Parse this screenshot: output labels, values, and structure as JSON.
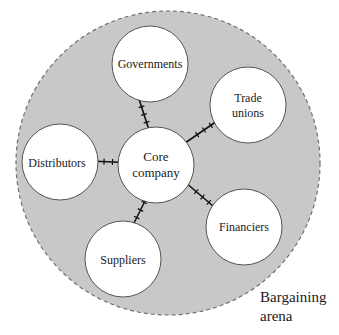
{
  "diagram": {
    "arena": {
      "label_line1": "Bargaining",
      "label_line2": "arena",
      "fill": "#c8c8c8",
      "border": "#707070",
      "cx": 168,
      "cy": 163,
      "r": 152
    },
    "core": {
      "label_line1": "Core",
      "label_line2": "company",
      "cx": 156,
      "cy": 165,
      "r": 38
    },
    "stakeholders": [
      {
        "id": "governments",
        "label_line1": "Governments",
        "label_line2": "",
        "cx": 150,
        "cy": 64,
        "r": 38
      },
      {
        "id": "trade-unions",
        "label_line1": "Trade",
        "label_line2": "unions",
        "cx": 248,
        "cy": 105,
        "r": 38
      },
      {
        "id": "distributors",
        "label_line1": "Distributors",
        "label_line2": "",
        "cx": 60,
        "cy": 162,
        "r": 38
      },
      {
        "id": "suppliers",
        "label_line1": "Suppliers",
        "label_line2": "",
        "cx": 123,
        "cy": 259,
        "r": 38
      },
      {
        "id": "financiers",
        "label_line1": "Financiers",
        "label_line2": "",
        "cx": 244,
        "cy": 227,
        "r": 38
      }
    ],
    "connectors": [
      {
        "to": "governments",
        "x1": 137,
        "y1": 93,
        "x2": 151,
        "y2": 136
      },
      {
        "to": "trade-unions",
        "x1": 185,
        "y1": 143,
        "x2": 223,
        "y2": 117
      },
      {
        "to": "distributors",
        "x1": 89,
        "y1": 161,
        "x2": 136,
        "y2": 163
      },
      {
        "to": "suppliers",
        "x1": 130,
        "y1": 231,
        "x2": 151,
        "y2": 189
      },
      {
        "to": "financiers",
        "x1": 185,
        "y1": 182,
        "x2": 220,
        "y2": 212
      }
    ],
    "colors": {
      "circle_fill": "#ffffff",
      "circle_stroke": "#555555",
      "connector": "#111111"
    }
  }
}
